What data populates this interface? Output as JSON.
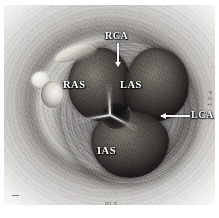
{
  "figure": {
    "modality": "grayscale anatomical cross-section"
  },
  "labels": {
    "rca": "RCA",
    "ras": "RAS",
    "las": "LAS",
    "ias": "IAS",
    "lca": "LCA"
  },
  "watermarks": {
    "side": "P S 1",
    "bottom": "PLS"
  },
  "colors": {
    "plate_background": "#b9b8b6",
    "tissue_mid": "#c9c7c3",
    "tissue_light": "#e4e3e0",
    "cusp_dark": "#2c2926",
    "label_text": "#ffffff",
    "leader_line": "#f4f3f0",
    "page_background": "#ffffff"
  }
}
